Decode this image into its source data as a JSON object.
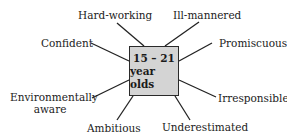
{
  "diagram": {
    "center": {
      "line1": "15 – 21",
      "line2": "year olds",
      "fill": "#d4d4d4"
    },
    "labels": {
      "hard_working": "Hard-working",
      "ill_mannered": "Ill-mannered",
      "confident": "Confident",
      "promiscuous": "Promiscuous",
      "environmentally_line1": "Environmentally",
      "environmentally_line2": "aware",
      "irresponsible": "Irresponsible",
      "ambitious": "Ambitious",
      "underestimated": "Underestimated"
    }
  }
}
